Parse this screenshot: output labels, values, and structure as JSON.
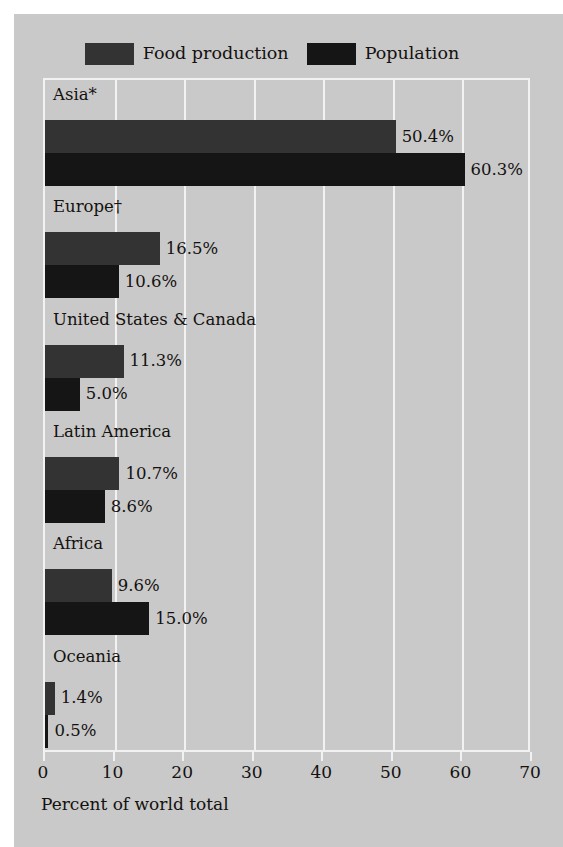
{
  "chart_data": {
    "type": "bar",
    "orientation": "horizontal",
    "title": "",
    "xlabel": "Percent of world total",
    "ylabel": "",
    "xlim": [
      0,
      70
    ],
    "xticks": [
      0,
      10,
      20,
      30,
      40,
      50,
      60,
      70
    ],
    "xtick_labels": [
      "0",
      "10",
      "20",
      "30",
      "40",
      "50",
      "60",
      "70"
    ],
    "grid": "vertical-white",
    "legend_position": "top-center",
    "categories": [
      "Asia*",
      "Europe†",
      "United States & Canada",
      "Latin America",
      "Africa",
      "Oceania"
    ],
    "series": [
      {
        "name": "Food production",
        "color": "#333333",
        "values": [
          50.4,
          16.5,
          11.3,
          10.7,
          9.6,
          1.4
        ],
        "labels": [
          "50.4%",
          "16.5%",
          "11.3%",
          "10.7%",
          "9.6%",
          "1.4%"
        ]
      },
      {
        "name": "Population",
        "color": "#151515",
        "values": [
          60.3,
          10.6,
          5.0,
          8.6,
          15.0,
          0.5
        ],
        "labels": [
          "60.3%",
          "10.6%",
          "5.0%",
          "8.6%",
          "15.0%",
          "0.5%"
        ]
      }
    ]
  },
  "legend": {
    "items": [
      {
        "label": "Food production",
        "color": "#333333"
      },
      {
        "label": "Population",
        "color": "#151515"
      }
    ]
  },
  "axis": {
    "xlabel": "Percent of world total",
    "ticks": [
      "0",
      "10",
      "20",
      "30",
      "40",
      "50",
      "60",
      "70"
    ]
  },
  "colors": {
    "panel_background": "#c9c9c9",
    "gridline": "#f2f2f2",
    "text": "#14110f",
    "food_production": "#333333",
    "population": "#151515"
  }
}
